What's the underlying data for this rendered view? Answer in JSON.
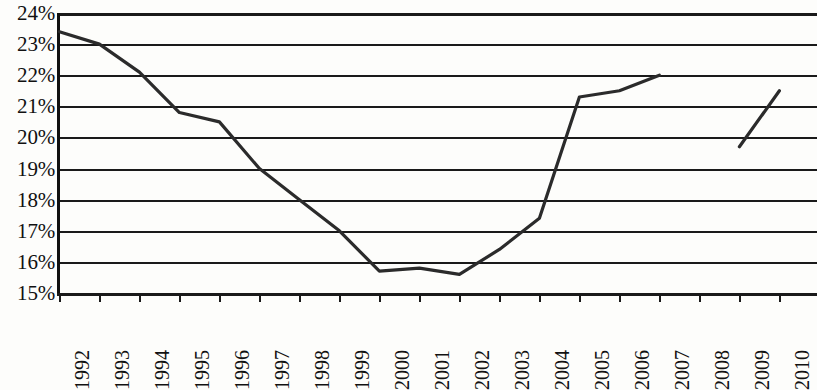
{
  "chart_data": {
    "type": "line",
    "title": "",
    "xlabel": "",
    "ylabel": "",
    "categories": [
      "1992",
      "1993",
      "1994",
      "1995",
      "1996",
      "1997",
      "1998",
      "1999",
      "2000",
      "2001",
      "2002",
      "2003",
      "2004",
      "2005",
      "2006",
      "2007",
      "2008",
      "2009",
      "2010"
    ],
    "series": [
      {
        "name": "",
        "values": [
          23.4,
          23.0,
          22.1,
          20.8,
          20.5,
          19.0,
          18.0,
          17.0,
          15.7,
          15.8,
          15.6,
          16.4,
          17.4,
          21.3,
          21.5,
          22.0,
          null,
          19.7,
          21.5
        ]
      }
    ],
    "ylim": [
      15,
      24
    ],
    "ytick_values": [
      24,
      23,
      22,
      21,
      20,
      19,
      18,
      17,
      16,
      15
    ],
    "ytick_labels": [
      "24%",
      "23%",
      "22%",
      "21%",
      "20%",
      "19%",
      "18%",
      "17%",
      "16%",
      "15%"
    ],
    "grid": true,
    "grid_axis": "y",
    "legend": false,
    "legend_position": "none",
    "annotations": [],
    "line_color": "#2b2b2b",
    "grid_color": "#1a1a1a",
    "background_color": "#fdfdfb"
  }
}
